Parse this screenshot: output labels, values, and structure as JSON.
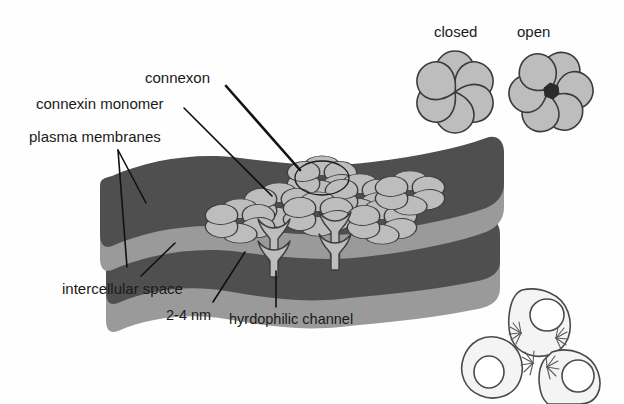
{
  "figure": {
    "background_color": "#fefefe",
    "width": 624,
    "height": 404
  },
  "colors": {
    "membrane_face": "#4f4f4f",
    "membrane_edge": "#9a9a9a",
    "connexon_fill": "#b4b4b4",
    "connexon_stroke": "#3a3a3a",
    "pore_dark": "#2e2e2e",
    "leader_line": "#111111",
    "text": "#1a1a1a",
    "cell_fill": "#f2f2f2",
    "cell_stroke": "#4a4a4a"
  },
  "labels": {
    "connexon": "connexon",
    "connexin_monomer": "connexin monomer",
    "plasma_membranes": "plasma membranes",
    "intercellular_space": "intercellular space",
    "gap_width": "2-4 nm",
    "hydrophilic_channel": "hyrdophilic channel",
    "closed": "closed",
    "open": "open"
  },
  "inset_connexons": [
    {
      "state": "closed",
      "subunits": 6,
      "pore": false,
      "cx": 455,
      "cy": 92
    },
    {
      "state": "open",
      "subunits": 6,
      "pore": true,
      "cx": 551,
      "cy": 92
    }
  ],
  "membrane_plaque": {
    "layers": 2,
    "connexon_count_top_face": 6,
    "channel_cross_sections": 2,
    "gap_label": "2-4 nm"
  },
  "cell_inset": {
    "cells": 3,
    "nuclei": 3,
    "junction_starbursts": 3
  }
}
